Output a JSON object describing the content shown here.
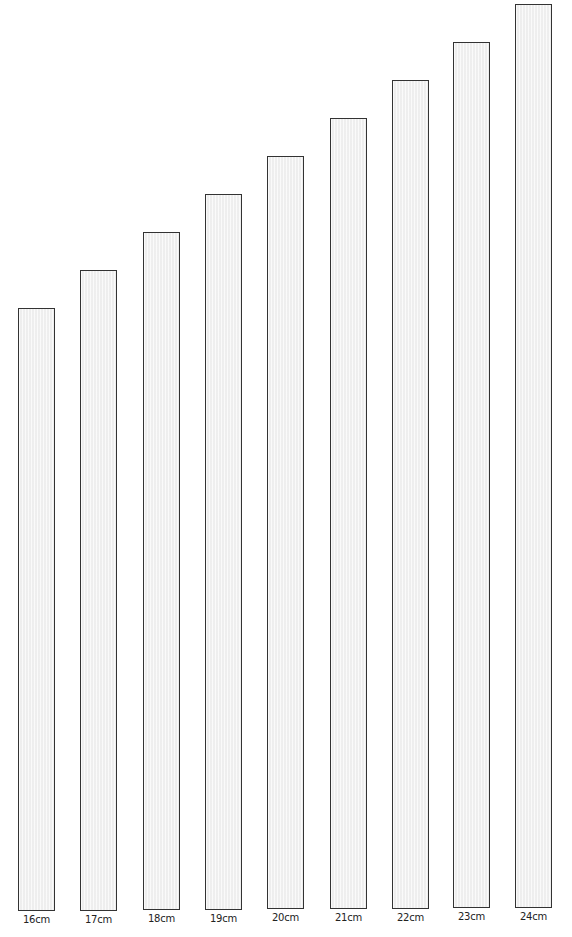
{
  "chart_data": {
    "type": "bar",
    "title": "",
    "xlabel": "",
    "ylabel": "",
    "categories": [
      "16cm",
      "17cm",
      "18cm",
      "19cm",
      "20cm",
      "21cm",
      "22cm",
      "23cm",
      "24cm"
    ],
    "values": [
      16,
      17,
      18,
      19,
      20,
      21,
      22,
      23,
      24
    ],
    "unit": "cm",
    "ylim": [
      0,
      24
    ],
    "grid": false,
    "legend": null,
    "bar_fill": "#f3f3f3",
    "bar_border": "#333333"
  },
  "layout": {
    "bars": [
      {
        "left": 18,
        "top": 308,
        "bottom": 911,
        "label_top": 914
      },
      {
        "left": 80,
        "top": 270,
        "bottom": 911,
        "label_top": 914
      },
      {
        "left": 143,
        "top": 232,
        "bottom": 910,
        "label_top": 913
      },
      {
        "left": 205,
        "top": 194,
        "bottom": 910,
        "label_top": 913
      },
      {
        "left": 267,
        "top": 156,
        "bottom": 909,
        "label_top": 912
      },
      {
        "left": 330,
        "top": 118,
        "bottom": 909,
        "label_top": 912
      },
      {
        "left": 392,
        "top": 80,
        "bottom": 909,
        "label_top": 912
      },
      {
        "left": 453,
        "top": 42,
        "bottom": 908,
        "label_top": 911
      },
      {
        "left": 515,
        "top": 4,
        "bottom": 908,
        "label_top": 911
      }
    ],
    "bar_width": 37
  }
}
